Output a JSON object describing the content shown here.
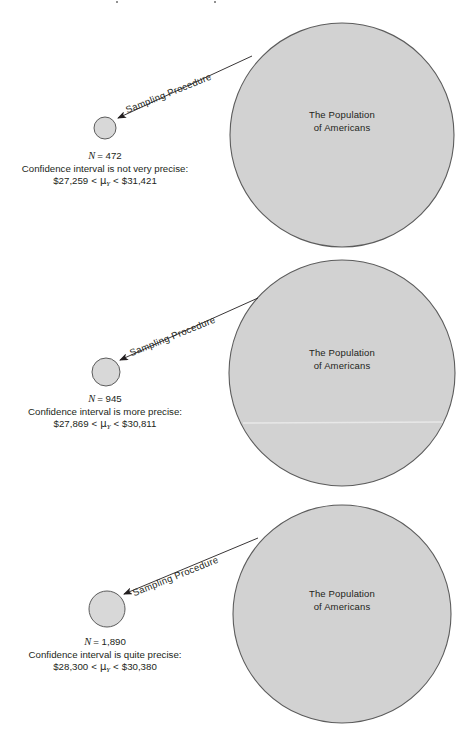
{
  "figure": {
    "background_color": "#ffffff",
    "circle_fill": "#d2d2d2",
    "circle_stroke": "#5c5c5c",
    "text_color": "#231f20",
    "width": 471,
    "height": 752
  },
  "panels": [
    {
      "id": "panel-1",
      "population_label_line1": "The Population",
      "population_label_line2": "of Americans",
      "arrow_label": "Sampling Procedure",
      "sample_size_prefix": "N",
      "sample_size_eq": "= 472",
      "precision_text": "Confidence interval is not very precise:",
      "ci_lower": "$27,259",
      "ci_op_left": "<",
      "ci_symbol": "μ",
      "ci_subscript": "Y",
      "ci_op_right": "<",
      "ci_upper": "$31,421",
      "population_circle": {
        "cx": 342,
        "cy": 135,
        "r": 112
      },
      "sample_circle": {
        "cx": 105,
        "cy": 128,
        "r": 11
      },
      "arrow": {
        "x1": 252,
        "y1": 56,
        "x2": 114,
        "y2": 120
      },
      "label_rotation_deg": -22
    },
    {
      "id": "panel-2",
      "population_label_line1": "The Population",
      "population_label_line2": "of Americans",
      "arrow_label": "Sampling Procedure",
      "sample_size_prefix": "N",
      "sample_size_eq": "= 945",
      "precision_text": "Confidence interval is more precise:",
      "ci_lower": "$27,869",
      "ci_op_left": "<",
      "ci_symbol": "μ",
      "ci_subscript": "Y",
      "ci_op_right": "<",
      "ci_upper": "$30,811",
      "population_circle": {
        "cx": 342,
        "cy": 373,
        "r": 113
      },
      "sample_circle": {
        "cx": 106,
        "cy": 372,
        "r": 14
      },
      "arrow": {
        "x1": 258,
        "y1": 298,
        "x2": 117,
        "y2": 362
      },
      "label_rotation_deg": -22
    },
    {
      "id": "panel-3",
      "population_label_line1": "The Population",
      "population_label_line2": "of Americans",
      "arrow_label": "Sampling Procedure",
      "sample_size_prefix": "N",
      "sample_size_eq": "= 1,890",
      "precision_text": "Confidence interval is quite precise:",
      "ci_lower": "$28,300",
      "ci_op_left": "<",
      "ci_symbol": "μ",
      "ci_subscript": "Y",
      "ci_op_right": "<",
      "ci_upper": "$30,380",
      "population_circle": {
        "cx": 342,
        "cy": 614,
        "r": 109
      },
      "sample_circle": {
        "cx": 107,
        "cy": 609,
        "r": 18
      },
      "arrow": {
        "x1": 258,
        "y1": 538,
        "x2": 120,
        "y2": 596
      },
      "label_rotation_deg": -22
    }
  ]
}
